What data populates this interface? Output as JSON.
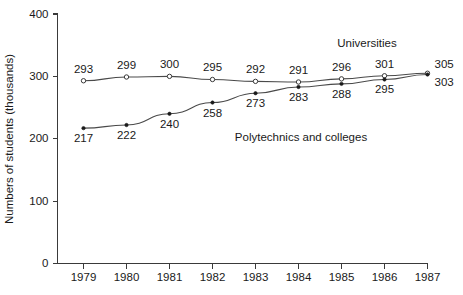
{
  "chart_data": {
    "type": "line",
    "title": "",
    "xlabel": "",
    "ylabel": "Numbers of students (thousands)",
    "categories": [
      "1979",
      "1980",
      "1981",
      "1982",
      "1983",
      "1984",
      "1985",
      "1986",
      "1987"
    ],
    "x": [
      1979,
      1980,
      1981,
      1982,
      1983,
      1984,
      1985,
      1986,
      1987
    ],
    "xlim": [
      1978.4,
      1987.6
    ],
    "ylim": [
      0,
      400
    ],
    "yticks": [
      0,
      100,
      200,
      300,
      400
    ],
    "ytick_labels": [
      "0",
      "100",
      "200",
      "300",
      "400"
    ],
    "grid": false,
    "legend_position": "inline-annotations",
    "series": [
      {
        "name": "Universities",
        "marker": "open-circle",
        "label_position": "above",
        "values": [
          293,
          299,
          300,
          295,
          292,
          291,
          296,
          301,
          305
        ],
        "data_labels": [
          "293",
          "299",
          "300",
          "295",
          "292",
          "291",
          "296",
          "301",
          "305"
        ]
      },
      {
        "name": "Polytechnics and colleges",
        "marker": "filled-circle",
        "label_position": "below",
        "values": [
          217,
          222,
          240,
          258,
          273,
          283,
          288,
          295,
          303
        ],
        "data_labels": [
          "217",
          "222",
          "240",
          "258",
          "273",
          "283",
          "288",
          "295",
          "303"
        ]
      }
    ],
    "annotations": [
      {
        "text": "Universities",
        "series": "Universities"
      },
      {
        "text": "Polytechnics and colleges",
        "series": "Polytechnics and colleges"
      }
    ],
    "colors": {
      "axis": "#3a3a3a",
      "line": "#4a4a4a",
      "text": "#1a1a1a",
      "background": "#ffffff"
    }
  }
}
